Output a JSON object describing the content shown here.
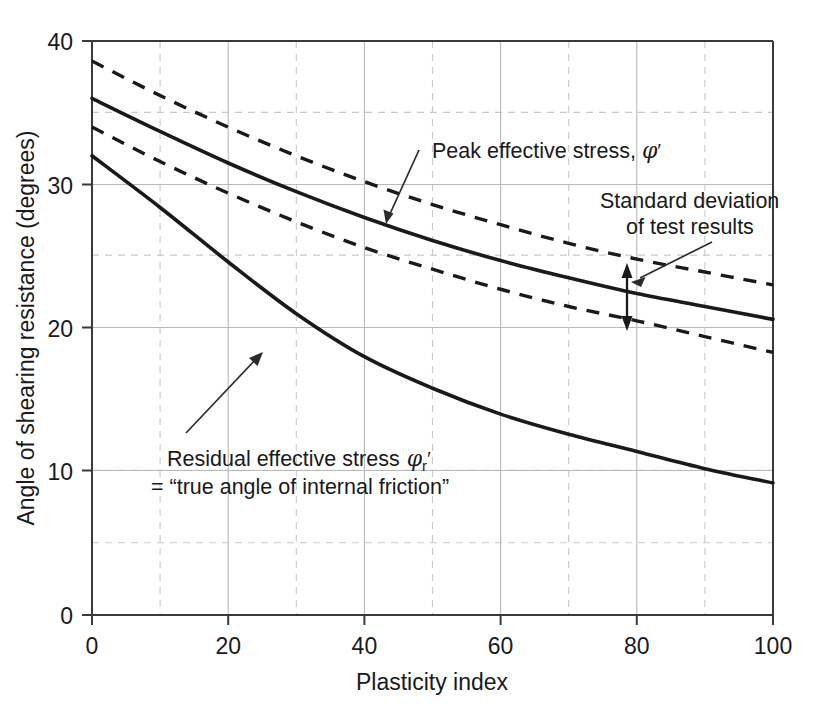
{
  "chart_data": {
    "type": "line",
    "title": "",
    "xlabel": "Plasticity index",
    "ylabel": "Angle of shearing resistance (degrees)",
    "xlim": [
      0,
      100
    ],
    "ylim": [
      0,
      40
    ],
    "xticks": [
      "0",
      "20",
      "40",
      "60",
      "80",
      "100"
    ],
    "yticks": [
      "0",
      "10",
      "20",
      "30",
      "40"
    ],
    "xtick_values": [
      0,
      20,
      40,
      60,
      80,
      100
    ],
    "ytick_values": [
      0,
      10,
      20,
      30,
      40
    ],
    "x_minor_step": 10,
    "y_minor_step": 5,
    "grid": "major solid light-gray, minor dashed light-gray",
    "legend_position": "inline annotations",
    "x": [
      0,
      10,
      20,
      30,
      40,
      50,
      60,
      70,
      80,
      90,
      100
    ],
    "series": [
      {
        "name": "Peak effective stress, upper standard deviation",
        "style": "dashed",
        "values": [
          38.6,
          36.2,
          34.0,
          32.0,
          30.2,
          28.6,
          27.2,
          25.9,
          24.8,
          23.9,
          23.0
        ]
      },
      {
        "name": "Peak effective stress",
        "style": "solid",
        "values": [
          36.0,
          33.7,
          31.5,
          29.5,
          27.7,
          26.1,
          24.7,
          23.5,
          22.4,
          21.5,
          20.6
        ]
      },
      {
        "name": "Peak effective stress, lower standard deviation",
        "style": "dashed",
        "values": [
          34.0,
          31.6,
          29.4,
          27.4,
          25.6,
          24.1,
          22.7,
          21.5,
          20.5,
          19.4,
          18.3
        ]
      },
      {
        "name": "Residual effective stress (true angle of internal friction)",
        "style": "solid",
        "values": [
          32.0,
          28.4,
          24.6,
          21.0,
          18.0,
          15.8,
          14.0,
          12.6,
          11.4,
          10.2,
          9.2
        ]
      }
    ],
    "annotations": [
      {
        "id": "peak-label",
        "text": "Peak effective stress, φ′",
        "points_to": "peak effective stress solid curve"
      },
      {
        "id": "stddev-label",
        "line1": "Standard deviation",
        "line2": "of test results",
        "points_to": "double-headed arrow between upper and lower dashed curves"
      },
      {
        "id": "residual-label",
        "line1": "Residual effective stress φr′",
        "line2": "= “true angle of internal friction”",
        "points_to": "residual effective stress solid curve"
      }
    ]
  },
  "axes": {
    "x_title": "Plasticity index",
    "y_title": "Angle of shearing resistance (degrees)"
  },
  "labels": {
    "peak_text_a": "Peak effective stress,",
    "peak_phi": "φ",
    "peak_prime": "′",
    "stddev_line1": "Standard deviation",
    "stddev_line2": "of test results",
    "residual_text_a": "Residual effective stress",
    "residual_phi": "φ",
    "residual_sub": "r",
    "residual_prime": "′",
    "residual_line2": "= “true angle of internal friction”"
  },
  "colors": {
    "curve": "#1a1a1a",
    "grid_major": "#b9b9b9",
    "grid_minor": "#c9c9c9",
    "axis": "#333333",
    "background": "#ffffff"
  }
}
